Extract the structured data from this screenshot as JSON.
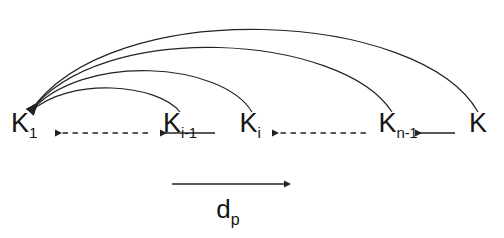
{
  "figure": {
    "background_color": "#ffffff",
    "stroke_color": "#222222",
    "text_color": "#151515",
    "width": 504,
    "height": 238
  },
  "nodes": [
    {
      "id": "k1",
      "base": "K",
      "sub": "1",
      "x": 24,
      "y": 124
    },
    {
      "id": "kim1",
      "base": "K",
      "sub": "i-1",
      "x": 180,
      "y": 124
    },
    {
      "id": "ki",
      "base": "K",
      "sub": "i",
      "x": 250,
      "y": 124
    },
    {
      "id": "knm1",
      "base": "K",
      "sub": "n-1",
      "x": 398,
      "y": 124
    },
    {
      "id": "kn",
      "base": "K",
      "sub": "",
      "x": 478,
      "y": 124
    }
  ],
  "chain_arrows": [
    {
      "id": "arrow-k1-dashed",
      "style": "dashed",
      "from_x": 148,
      "to_x": 55,
      "y": 133
    },
    {
      "id": "arrow-kim1-solid",
      "style": "solid",
      "from_x": 215,
      "to_x": 160,
      "y": 133
    },
    {
      "id": "arrow-ki-solid",
      "style": "solid",
      "from_x": 232,
      "to_x": 196,
      "y": 133
    },
    {
      "id": "arrow-ki-dashed",
      "style": "dashed",
      "from_x": 366,
      "to_x": 272,
      "y": 133
    },
    {
      "id": "arrow-knm1-solid",
      "style": "solid",
      "from_x": 434,
      "to_x": 378,
      "y": 133
    },
    {
      "id": "arrow-kn-solid",
      "style": "solid",
      "from_x": 455,
      "to_x": 415,
      "y": 133
    }
  ],
  "arcs": [
    {
      "id": "arc-k-to-k1",
      "from_x": 478,
      "from_y": 112,
      "apex_x": 250,
      "apex_y": 22,
      "to_x": 30,
      "to_y": 112
    },
    {
      "id": "arc-knm1-to-k1",
      "from_x": 392,
      "from_y": 112,
      "apex_x": 214,
      "apex_y": 45,
      "to_x": 30,
      "to_y": 112
    },
    {
      "id": "arc-ki-to-k1",
      "from_x": 252,
      "from_y": 112,
      "apex_x": 150,
      "apex_y": 78,
      "to_x": 30,
      "to_y": 112
    },
    {
      "id": "arc-kim1-to-k1",
      "from_x": 180,
      "from_y": 112,
      "apex_x": 112,
      "apex_y": 100,
      "to_x": 30,
      "to_y": 112
    }
  ],
  "axis": {
    "arrow": {
      "from_x": 172,
      "to_x": 284,
      "y": 184
    },
    "label_base": "d",
    "label_sub": "p",
    "label_x": 228,
    "label_y": 196
  }
}
